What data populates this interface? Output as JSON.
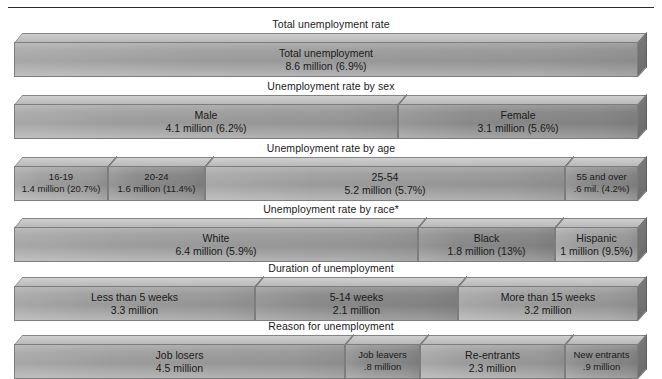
{
  "chart_data": {
    "type": "bar",
    "title": "",
    "subtype": "stacked-horizontal-breakdown",
    "note": "*Persons of Hispanic origin may also be counted in the white or black categories.",
    "rows": [
      {
        "title": "Total unemployment rate",
        "segments": [
          {
            "label": "Total unemployment",
            "value": "8.6 million (6.9%)",
            "millions": 8.6,
            "percent": 6.9
          }
        ]
      },
      {
        "title": "Unemployment rate by sex",
        "segments": [
          {
            "label": "Male",
            "value": "4.1 million (6.2%)",
            "millions": 4.1,
            "percent": 6.2
          },
          {
            "label": "Female",
            "value": "3.1 million (5.6%)",
            "millions": 3.1,
            "percent": 5.6
          }
        ]
      },
      {
        "title": "Unemployment rate by age",
        "segments": [
          {
            "label": "16-19",
            "value": "1.4 million (20.7%)",
            "millions": 1.4,
            "percent": 20.7
          },
          {
            "label": "20-24",
            "value": "1.6 million (11.4%)",
            "millions": 1.6,
            "percent": 11.4
          },
          {
            "label": "25-54",
            "value": "5.2 million (5.7%)",
            "millions": 5.2,
            "percent": 5.7
          },
          {
            "label": "55 and over",
            "value": ".6 mil. (4.2%)",
            "millions": 0.6,
            "percent": 4.2
          }
        ]
      },
      {
        "title": "Unemployment rate by race*",
        "segments": [
          {
            "label": "White",
            "value": "6.4 million (5.9%)",
            "millions": 6.4,
            "percent": 5.9
          },
          {
            "label": "Black",
            "value": "1.8 million (13%)",
            "millions": 1.8,
            "percent": 13
          },
          {
            "label": "Hispanic",
            "value": "1 million (9.5%)",
            "millions": 1.0,
            "percent": 9.5
          }
        ]
      },
      {
        "title": "Duration of unemployment",
        "segments": [
          {
            "label": "Less than 5 weeks",
            "value": "3.3 million",
            "millions": 3.3
          },
          {
            "label": "5-14 weeks",
            "value": "2.1 million",
            "millions": 2.1
          },
          {
            "label": "More than 15 weeks",
            "value": "3.2 million",
            "millions": 3.2
          }
        ]
      },
      {
        "title": "Reason for unemployment",
        "segments": [
          {
            "label": "Job losers",
            "value": "4.5 million",
            "millions": 4.5
          },
          {
            "label": "Job leavers",
            "value": ".8 million",
            "millions": 0.8
          },
          {
            "label": "Re-entrants",
            "value": "2.3 million",
            "millions": 2.3
          },
          {
            "label": "New entrants",
            "value": ".9 million",
            "millions": 0.9
          }
        ]
      }
    ]
  },
  "layout": {
    "bar_left": 14,
    "bar_right": 638,
    "row_tops": [
      18,
      80,
      142,
      203,
      262,
      320
    ],
    "row_segment_bounds": [
      [
        14,
        638
      ],
      [
        14,
        398,
        638
      ],
      [
        14,
        108,
        205,
        565,
        638
      ],
      [
        14,
        418,
        555,
        638
      ],
      [
        14,
        255,
        458,
        638
      ],
      [
        14,
        345,
        420,
        565,
        638
      ]
    ],
    "narrow_flags": [
      [
        false
      ],
      [
        false,
        false
      ],
      [
        true,
        true,
        false,
        true
      ],
      [
        false,
        false,
        false
      ],
      [
        false,
        false,
        false
      ],
      [
        false,
        true,
        false,
        true
      ]
    ]
  },
  "colors": {
    "bar_front_light": "#a3a3a3",
    "bar_front_dark": "#8f8f8f",
    "bar_top": "#cfcfcf",
    "bar_side": "#777777",
    "outline": "#7d7d7d",
    "text": "#1a1a1a",
    "rule": "#2a2a2a",
    "background": "#ffffff"
  }
}
